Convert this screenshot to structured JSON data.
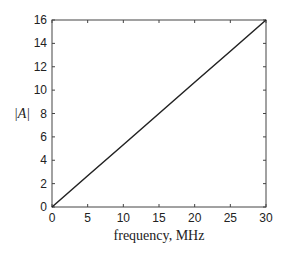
{
  "chart_data": {
    "type": "line",
    "title": "",
    "xlabel": "frequency, MHz",
    "ylabel": "|A|",
    "xlim": [
      0,
      30
    ],
    "ylim": [
      0,
      16
    ],
    "xticks": [
      0,
      5,
      10,
      15,
      20,
      25,
      30
    ],
    "yticks": [
      0,
      2,
      4,
      6,
      8,
      10,
      12,
      14,
      16
    ],
    "xtick_labels": [
      "0",
      "5",
      "10",
      "15",
      "20",
      "25",
      "30"
    ],
    "ytick_labels": [
      "0",
      "2",
      "4",
      "6",
      "8",
      "10",
      "12",
      "14",
      "16"
    ],
    "grid": false,
    "legend": null,
    "series": [
      {
        "name": "|A|",
        "x": [
          0,
          5,
          10,
          15,
          20,
          25,
          30
        ],
        "y": [
          0,
          2.67,
          5.33,
          8,
          10.67,
          13.33,
          16
        ],
        "color": "#222222"
      }
    ]
  }
}
